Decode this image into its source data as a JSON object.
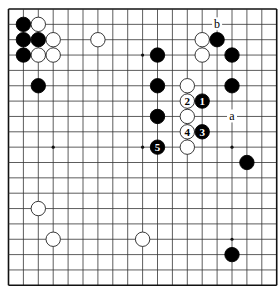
{
  "diagram": {
    "type": "go-board-diagram",
    "board_size": 19,
    "geometry": {
      "origin_x": 8.5,
      "origin_y": 9,
      "spacing_x": 14.9,
      "spacing_y": 15.35,
      "stone_radius": 7.2,
      "star_radius": 1.6
    },
    "colors": {
      "background": "#ffffff",
      "grid": "#333333",
      "border": "#111111",
      "black_stone": "#000000",
      "white_stone_fill": "#ffffff",
      "white_stone_stroke": "#222222",
      "label_on_black": "#ffffff",
      "label_on_white": "#000000"
    },
    "star_points": [
      {
        "col": 3,
        "row": 3
      },
      {
        "col": 9,
        "row": 3
      },
      {
        "col": 15,
        "row": 3
      },
      {
        "col": 3,
        "row": 9
      },
      {
        "col": 9,
        "row": 9
      },
      {
        "col": 15,
        "row": 9
      },
      {
        "col": 3,
        "row": 15
      },
      {
        "col": 9,
        "row": 15
      },
      {
        "col": 15,
        "row": 15
      }
    ],
    "stones": [
      {
        "color": "black",
        "col": 1,
        "row": 1
      },
      {
        "color": "white",
        "col": 2,
        "row": 1
      },
      {
        "color": "black",
        "col": 1,
        "row": 2
      },
      {
        "color": "black",
        "col": 2,
        "row": 2
      },
      {
        "color": "white",
        "col": 3,
        "row": 2
      },
      {
        "color": "black",
        "col": 1,
        "row": 3
      },
      {
        "color": "white",
        "col": 2,
        "row": 3
      },
      {
        "color": "white",
        "col": 3,
        "row": 3
      },
      {
        "color": "white",
        "col": 6,
        "row": 2
      },
      {
        "color": "black",
        "col": 2,
        "row": 5
      },
      {
        "color": "white",
        "col": 13,
        "row": 2
      },
      {
        "color": "black",
        "col": 14,
        "row": 2
      },
      {
        "color": "black",
        "col": 10,
        "row": 3
      },
      {
        "color": "white",
        "col": 13,
        "row": 3
      },
      {
        "color": "black",
        "col": 15,
        "row": 3
      },
      {
        "color": "black",
        "col": 10,
        "row": 5
      },
      {
        "color": "white",
        "col": 12,
        "row": 5
      },
      {
        "color": "black",
        "col": 15,
        "row": 5
      },
      {
        "color": "white",
        "col": 12,
        "row": 6,
        "label": "2"
      },
      {
        "color": "black",
        "col": 13,
        "row": 6,
        "label": "1"
      },
      {
        "color": "black",
        "col": 10,
        "row": 7
      },
      {
        "color": "white",
        "col": 12,
        "row": 7
      },
      {
        "color": "white",
        "col": 12,
        "row": 8,
        "label": "4"
      },
      {
        "color": "black",
        "col": 13,
        "row": 8,
        "label": "3"
      },
      {
        "color": "black",
        "col": 10,
        "row": 9,
        "label": "5"
      },
      {
        "color": "white",
        "col": 12,
        "row": 9
      },
      {
        "color": "black",
        "col": 16,
        "row": 10
      },
      {
        "color": "white",
        "col": 2,
        "row": 13
      },
      {
        "color": "white",
        "col": 3,
        "row": 15
      },
      {
        "color": "white",
        "col": 9,
        "row": 15
      },
      {
        "color": "black",
        "col": 15,
        "row": 16
      }
    ],
    "markers": [
      {
        "label": "a",
        "col": 15,
        "row": 7
      },
      {
        "label": "b",
        "col": 14,
        "row": 1
      }
    ]
  }
}
